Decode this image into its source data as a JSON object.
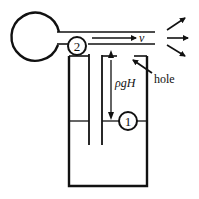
{
  "diagram": {
    "colors": {
      "stroke": "#111111",
      "background": "#ffffff"
    },
    "labels": {
      "point_2": "2",
      "point_1": "1",
      "velocity": "v",
      "pressure_head": "ρgH",
      "hole": "hole"
    },
    "components": [
      "squeeze-bulb",
      "air-tube",
      "point-2-marker",
      "spray-arrows",
      "container",
      "feed-tube",
      "vent-tube",
      "water-level",
      "point-1-marker",
      "pressure-head-arrow",
      "hole-pointer"
    ]
  }
}
